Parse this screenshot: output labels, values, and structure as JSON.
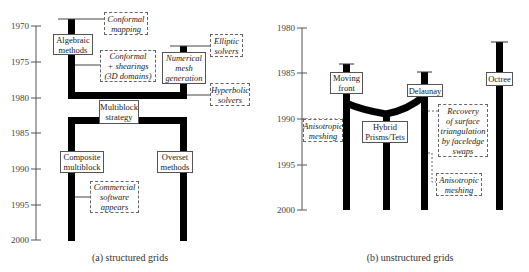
{
  "panels": [
    {
      "caption": "(a) structured grids",
      "axis": {
        "ticks": [
          "1970",
          "1975",
          "1980",
          "1985",
          "1990",
          "1995",
          "2000"
        ]
      },
      "methods": [
        {
          "lines": [
            "Algebraic",
            "methods"
          ]
        },
        {
          "lines": [
            "Numerical",
            "mesh",
            "generation"
          ]
        },
        {
          "lines": [
            "Multiblock",
            "strategy"
          ]
        },
        {
          "lines": [
            "Composite",
            "multiblock"
          ]
        },
        {
          "lines": [
            "Overset",
            "methods"
          ]
        }
      ],
      "annotations": [
        {
          "lines": [
            "Conformal",
            "mapping"
          ]
        },
        {
          "lines": [
            "Conformal",
            "+ shearings",
            "(3D domains)"
          ]
        },
        {
          "lines": [
            "Elliptic",
            "solvers"
          ]
        },
        {
          "lines": [
            "Hyperbolic",
            "solvers"
          ]
        },
        {
          "lines": [
            "Commercial",
            "software",
            "appears"
          ]
        }
      ]
    },
    {
      "caption": "(b) unstructured grids",
      "axis": {
        "ticks": [
          "1980",
          "1985",
          "1990",
          "1995",
          "2000"
        ]
      },
      "methods": [
        {
          "lines": [
            "Moving",
            "front"
          ]
        },
        {
          "lines": [
            "Delaunay"
          ]
        },
        {
          "lines": [
            "Octree"
          ]
        },
        {
          "lines": [
            "Hybrid",
            "Prisms/Tets"
          ]
        }
      ],
      "annotations": [
        {
          "lines": [
            "Anisotropic",
            "meshing"
          ]
        },
        {
          "lines": [
            "Recovery",
            "of surface",
            "triangulation",
            "by faceledge",
            "swaps"
          ]
        },
        {
          "lines": [
            "Anisotropic",
            "meshing"
          ]
        }
      ]
    }
  ]
}
